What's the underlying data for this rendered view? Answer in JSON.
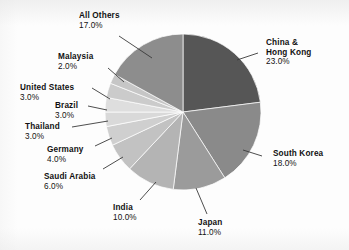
{
  "chart_data": {
    "type": "pie",
    "title": "",
    "subtitle": "",
    "xlabel": "",
    "ylabel": "",
    "legend_position": "none",
    "grid": false,
    "units": "percent",
    "start_angle_deg": 0,
    "direction": "clockwise",
    "categories": [
      "China & Hong Kong",
      "South Korea",
      "Japan",
      "India",
      "Saudi Arabia",
      "Germany",
      "Thailand",
      "Brazil",
      "United States",
      "Malaysia",
      "All Others"
    ],
    "values": [
      23.0,
      18.0,
      11.0,
      10.0,
      6.0,
      4.0,
      3.0,
      3.0,
      3.0,
      2.0,
      17.0
    ],
    "value_labels": [
      "23.0%",
      "18.0%",
      "11.0%",
      "10.0%",
      "6.0%",
      "4.0%",
      "3.0%",
      "3.0%",
      "3.0%",
      "2.0%",
      "17.0%"
    ],
    "colors": [
      "#565656",
      "#8a8a8a",
      "#9b9b9b",
      "#b4b4b4",
      "#c2c2c2",
      "#cfcfcf",
      "#d9d9d9",
      "#dedede",
      "#cbcbcb",
      "#c6c6c6",
      "#8d8d8d"
    ],
    "slices": [
      {
        "label": "China & Hong Kong",
        "label_line_1": "China &",
        "label_line_2": "Hong Kong",
        "value": 23.0,
        "value_label": "23.0%",
        "color": "#565656"
      },
      {
        "label": "South Korea",
        "label_line_1": "South Korea",
        "label_line_2": "",
        "value": 18.0,
        "value_label": "18.0%",
        "color": "#8a8a8a"
      },
      {
        "label": "Japan",
        "label_line_1": "Japan",
        "label_line_2": "",
        "value": 11.0,
        "value_label": "11.0%",
        "color": "#9b9b9b"
      },
      {
        "label": "India",
        "label_line_1": "India",
        "label_line_2": "",
        "value": 10.0,
        "value_label": "10.0%",
        "color": "#b4b4b4"
      },
      {
        "label": "Saudi Arabia",
        "label_line_1": "Saudi Arabia",
        "label_line_2": "",
        "value": 6.0,
        "value_label": "6.0%",
        "color": "#c2c2c2"
      },
      {
        "label": "Germany",
        "label_line_1": "Germany",
        "label_line_2": "",
        "value": 4.0,
        "value_label": "4.0%",
        "color": "#cfcfcf"
      },
      {
        "label": "Thailand",
        "label_line_1": "Thailand",
        "label_line_2": "",
        "value": 3.0,
        "value_label": "3.0%",
        "color": "#d9d9d9"
      },
      {
        "label": "Brazil",
        "label_line_1": "Brazil",
        "label_line_2": "",
        "value": 3.0,
        "value_label": "3.0%",
        "color": "#dedede"
      },
      {
        "label": "United States",
        "label_line_1": "United States",
        "label_line_2": "",
        "value": 3.0,
        "value_label": "3.0%",
        "color": "#cbcbcb"
      },
      {
        "label": "Malaysia",
        "label_line_1": "Malaysia",
        "label_line_2": "",
        "value": 2.0,
        "value_label": "2.0%",
        "color": "#c6c6c6"
      },
      {
        "label": "All Others",
        "label_line_1": "All Others",
        "label_line_2": "",
        "value": 17.0,
        "value_label": "17.0%",
        "color": "#8d8d8d"
      }
    ]
  },
  "geometry": {
    "center_x": 183,
    "center_y": 112,
    "radius": 78
  },
  "labels": {
    "all_others": {
      "name": "All Others",
      "pct": "17.0%"
    },
    "china": {
      "name_1": "China &",
      "name_2": "Hong Kong",
      "pct": "23.0%"
    },
    "south_korea": {
      "name": "South Korea",
      "pct": "18.0%"
    },
    "japan": {
      "name": "Japan",
      "pct": "11.0%"
    },
    "india": {
      "name": "India",
      "pct": "10.0%"
    },
    "saudi_arabia": {
      "name": "Saudi Arabia",
      "pct": "6.0%"
    },
    "germany": {
      "name": "Germany",
      "pct": "4.0%"
    },
    "thailand": {
      "name": "Thailand",
      "pct": "3.0%"
    },
    "brazil": {
      "name": "Brazil",
      "pct": "3.0%"
    },
    "united_states": {
      "name": "United States",
      "pct": "3.0%"
    },
    "malaysia": {
      "name": "Malaysia",
      "pct": "2.0%"
    }
  }
}
